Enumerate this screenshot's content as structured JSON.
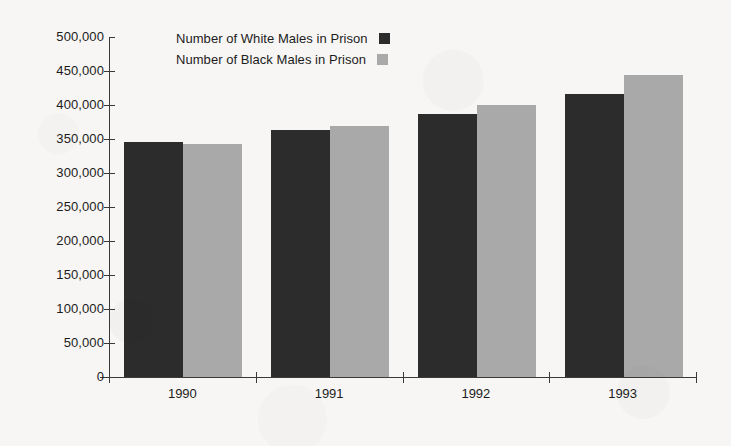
{
  "chart_data": {
    "type": "bar",
    "title": "",
    "subtitle": "",
    "xlabel": "",
    "ylabel": "",
    "categories": [
      "1990",
      "1991",
      "1992",
      "1993"
    ],
    "series": [
      {
        "name": "Number of White Males in Prison",
        "color": "#2c2c2c",
        "values": [
          346000,
          363000,
          387000,
          416000
        ]
      },
      {
        "name": "Number of Black Males in Prison",
        "color": "#a9a9a9",
        "values": [
          342000,
          369000,
          400000,
          444000
        ]
      }
    ],
    "ylim": [
      0,
      500000
    ],
    "ytick_values": [
      0,
      50000,
      100000,
      150000,
      200000,
      250000,
      300000,
      350000,
      400000,
      450000,
      500000
    ],
    "ytick_labels": [
      "0",
      "50,000",
      "100,000",
      "150,000",
      "200,000",
      "250,000",
      "300,000",
      "350,000",
      "400,000",
      "450,000",
      "500,000"
    ],
    "grid": false,
    "legend_position": "top-center",
    "background_color": "#f7f6f4",
    "axis_color": "#3a3a3a",
    "text_color": "#1c1c1c"
  },
  "legend": {
    "entries": [
      {
        "label": "Number of White Males in Prison",
        "swatch": "#2c2c2c"
      },
      {
        "label": "Number of Black Males in Prison",
        "swatch": "#a9a9a9"
      }
    ]
  }
}
